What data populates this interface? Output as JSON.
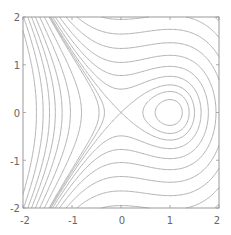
{
  "chart_data": {
    "type": "contour",
    "title": "",
    "xlabel": "",
    "ylabel": "",
    "xlim": [
      -2,
      2
    ],
    "ylim": [
      -2,
      2
    ],
    "x_ticks": [
      "-2",
      "-1",
      "0",
      "1",
      "2"
    ],
    "y_ticks": [
      "-2",
      "-1",
      "0",
      "1",
      "2"
    ],
    "function": "y^2/2 - x^2/2 + x^3/3",
    "levels": [
      -0.13,
      -0.07,
      0,
      0.12,
      0.3,
      0.55,
      0.9,
      1.35,
      1.9,
      2.5,
      -0.5,
      -0.9,
      -1.3,
      -1.7,
      -2.1,
      -2.6,
      -3.2
    ],
    "features": {
      "saddle": [
        0,
        0
      ],
      "center": [
        1,
        0
      ]
    },
    "line_color": "#a8a8a8",
    "grid": false,
    "legend": "none"
  }
}
